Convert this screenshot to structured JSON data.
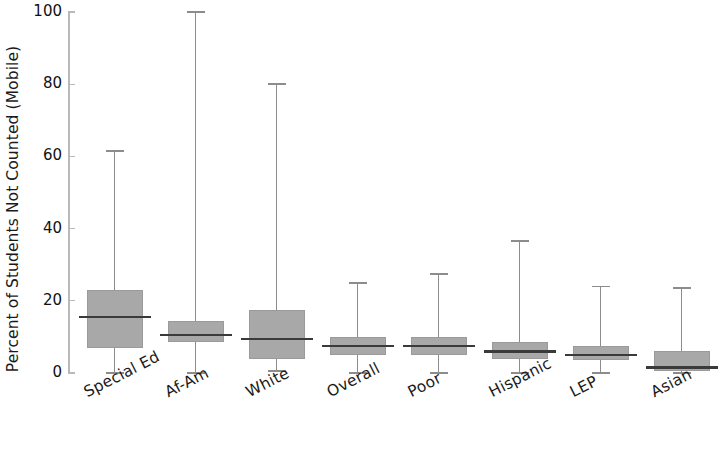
{
  "chart_data": {
    "type": "box",
    "title": "",
    "xlabel": "",
    "ylabel": "Percent of Students Not Counted (Mobile)",
    "ylim": [
      0,
      100
    ],
    "yticks": [
      0,
      20,
      40,
      60,
      80,
      100
    ],
    "ytick_labels": [
      "0",
      "20",
      "40",
      "60",
      "80",
      "100"
    ],
    "grid": false,
    "legend": "none",
    "categories": [
      "Special Ed",
      "Af-Am",
      "White",
      "Overall",
      "Poor",
      "Hispanic",
      "LEP",
      "Asian"
    ],
    "boxes": [
      {
        "category": "Special Ed",
        "whisker_low": 0.0,
        "q1": 7.0,
        "median": 15.5,
        "q3": 23.0,
        "whisker_high": 61.5
      },
      {
        "category": "Af-Am",
        "whisker_low": 0.0,
        "q1": 8.5,
        "median": 10.5,
        "q3": 14.5,
        "whisker_high": 100.0
      },
      {
        "category": "White",
        "whisker_low": 0.5,
        "q1": 4.0,
        "median": 9.5,
        "q3": 17.5,
        "whisker_high": 80.0
      },
      {
        "category": "Overall",
        "whisker_low": 0.0,
        "q1": 5.0,
        "median": 7.5,
        "q3": 10.0,
        "whisker_high": 25.0
      },
      {
        "category": "Poor",
        "whisker_low": 0.0,
        "q1": 5.0,
        "median": 7.5,
        "q3": 10.0,
        "whisker_high": 27.5
      },
      {
        "category": "Hispanic",
        "whisker_low": 0.0,
        "q1": 4.0,
        "median": 6.0,
        "q3": 8.5,
        "whisker_high": 36.5
      },
      {
        "category": "LEP",
        "whisker_low": 0.0,
        "q1": 3.5,
        "median": 5.0,
        "q3": 7.5,
        "whisker_high": 24.0
      },
      {
        "category": "Asian",
        "whisker_low": 0.0,
        "q1": 0.5,
        "median": 1.5,
        "q3": 6.0,
        "whisker_high": 23.5
      }
    ],
    "colors": {
      "box_fill": "#a8a8a8",
      "box_edge": "#9a9a9a",
      "median": "#3a3a3a",
      "whisker": "#8c8c8c",
      "axis": "#b9b9b9",
      "text": "#1a1a1a",
      "background": "#ffffff"
    }
  }
}
